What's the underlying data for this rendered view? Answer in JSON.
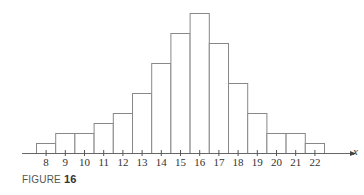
{
  "chart_data": {
    "type": "bar",
    "title": "",
    "xlabel": "x",
    "ylabel": "",
    "categories": [
      "8",
      "9",
      "10",
      "11",
      "12",
      "13",
      "14",
      "15",
      "16",
      "17",
      "18",
      "19",
      "20",
      "21",
      "22"
    ],
    "values": [
      1,
      2,
      2,
      3,
      4,
      6,
      9,
      12,
      14,
      11,
      7,
      4,
      2,
      2,
      1
    ],
    "ylim": [
      0,
      14
    ],
    "grid": false,
    "legend": null,
    "histogram": true
  },
  "figure": {
    "caption_prefix": "FIGURE ",
    "caption_number": "16"
  },
  "colors": {
    "bar_stroke": "#888888",
    "bar_fill": "#ffffff",
    "axis": "#666666"
  }
}
